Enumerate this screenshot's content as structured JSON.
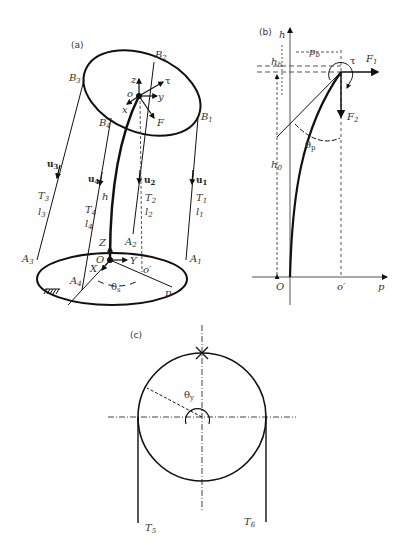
{
  "figure": {
    "panels": [
      {
        "id": "a",
        "label": "(a)",
        "top_points": [
          "B1",
          "B2",
          "B3",
          "B4"
        ],
        "base_points": [
          "A1",
          "A2",
          "A3",
          "A4"
        ],
        "cables": [
          {
            "u": "u1",
            "T": "T1",
            "l": "l1"
          },
          {
            "u": "u2",
            "T": "T2",
            "l": "l2"
          },
          {
            "u": "u3",
            "T": "T3",
            "l": "l3"
          },
          {
            "u": "u4",
            "T": "T4",
            "l": "l4"
          }
        ],
        "top_frame": {
          "origin": "o",
          "axes": [
            "x",
            "y",
            "z"
          ],
          "torque": "τ",
          "force": "F"
        },
        "base_frame": {
          "origin": "O",
          "axes": [
            "X",
            "Y",
            "Z"
          ]
        },
        "other": {
          "height": "h",
          "projection": "o′",
          "point": "p",
          "angle": "θs"
        }
      },
      {
        "id": "b",
        "label": "(b)",
        "axes": {
          "vertical": "h",
          "horizontal": "p",
          "origin": "O",
          "mark": "o′"
        },
        "dims": {
          "hb": "hb",
          "pb": "pb",
          "h0": "h0"
        },
        "forces": [
          "F1",
          "F2"
        ],
        "torque": "τ",
        "angle": "θp"
      },
      {
        "id": "c",
        "label": "(c)",
        "angle": "θy",
        "cables": [
          "T5",
          "T6"
        ]
      }
    ]
  }
}
